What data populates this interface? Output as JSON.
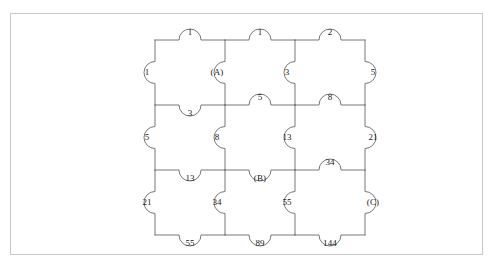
{
  "figure": {
    "kind": "jigsaw-puzzle-diagram",
    "rows": 3,
    "cols": 3,
    "stroke_color": "#555555",
    "frame_color": "#c9c9c9",
    "background": "#ffffff",
    "text_color": "#1a1a1a"
  },
  "geometry": {
    "col_x": [
      155,
      225,
      295,
      365
    ],
    "row_y": [
      40,
      105,
      170,
      235
    ],
    "tab_radius": 11
  },
  "edges": {
    "top": [
      {
        "id": "top-1",
        "label": "1",
        "x": 190,
        "y": 32
      },
      {
        "id": "top-2",
        "label": "1",
        "x": 260,
        "y": 32
      },
      {
        "id": "top-3",
        "label": "2",
        "x": 330,
        "y": 32
      }
    ],
    "bottom": [
      {
        "id": "bottom-1",
        "label": "55",
        "x": 190,
        "y": 243
      },
      {
        "id": "bottom-2",
        "label": "89",
        "x": 260,
        "y": 243
      },
      {
        "id": "bottom-3",
        "label": "144",
        "x": 330,
        "y": 243
      }
    ],
    "left": [
      {
        "id": "left-1",
        "label": "1",
        "x": 147,
        "y": 72
      },
      {
        "id": "left-2",
        "label": "5",
        "x": 147,
        "y": 137
      },
      {
        "id": "left-3",
        "label": "21",
        "x": 147,
        "y": 202
      }
    ],
    "right": [
      {
        "id": "right-1",
        "label": "5",
        "x": 373,
        "y": 72
      },
      {
        "id": "right-2",
        "label": "21",
        "x": 373,
        "y": 137
      },
      {
        "id": "right-3",
        "label": "(C)",
        "x": 373,
        "y": 202
      }
    ],
    "vertical_seams": [
      {
        "id": "vseam-1-r1",
        "label": "(A)",
        "x": 217,
        "y": 72
      },
      {
        "id": "vseam-1-r2",
        "label": "8",
        "x": 217,
        "y": 137
      },
      {
        "id": "vseam-1-r3",
        "label": "34",
        "x": 217,
        "y": 202
      },
      {
        "id": "vseam-2-r1",
        "label": "3",
        "x": 287,
        "y": 72
      },
      {
        "id": "vseam-2-r2",
        "label": "13",
        "x": 287,
        "y": 137
      },
      {
        "id": "vseam-2-r3",
        "label": "55",
        "x": 287,
        "y": 202
      }
    ],
    "horizontal_seams": [
      {
        "id": "hseam-1-c1",
        "label": "3",
        "x": 190,
        "y": 113
      },
      {
        "id": "hseam-1-c2",
        "label": "5",
        "x": 260,
        "y": 97
      },
      {
        "id": "hseam-1-c3",
        "label": "8",
        "x": 330,
        "y": 97
      },
      {
        "id": "hseam-2-c1",
        "label": "13",
        "x": 190,
        "y": 178
      },
      {
        "id": "hseam-2-c2",
        "label": "(B)",
        "x": 260,
        "y": 178
      },
      {
        "id": "hseam-2-c3",
        "label": "34",
        "x": 330,
        "y": 162
      }
    ]
  },
  "chart_data": {
    "type": "diagram",
    "title": "",
    "tab_values": [
      "1",
      "1",
      "2",
      "1",
      "(A)",
      "3",
      "5",
      "3",
      "5",
      "8",
      "5",
      "8",
      "13",
      "21",
      "13",
      "(B)",
      "34",
      "21",
      "34",
      "55",
      "(C)",
      "55",
      "89",
      "144"
    ],
    "unknowns": [
      "(A)",
      "(B)",
      "(C)"
    ]
  }
}
